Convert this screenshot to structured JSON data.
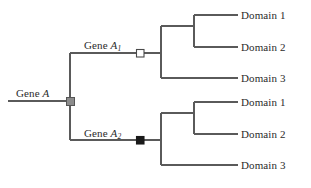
{
  "figure": {
    "background_color": "#ffffff",
    "line_color": "#5a5a5a",
    "text_color": "#2b2b2b"
  },
  "root": {
    "label_prefix": "Gene ",
    "label_gene": "A",
    "node_marker": "gray-square",
    "node_color": "#8c8c8c"
  },
  "branches": [
    {
      "label_prefix": "Gene ",
      "label_gene": "A",
      "label_subscript": "1",
      "node_marker": "white-square",
      "node_color": "#ffffff",
      "leaves": [
        {
          "label": "Domain 1"
        },
        {
          "label": "Domain 2"
        },
        {
          "label": "Domain 3"
        }
      ]
    },
    {
      "label_prefix": "Gene ",
      "label_gene": "A",
      "label_subscript": "2",
      "node_marker": "black-square",
      "node_color": "#1a1a1a",
      "leaves": [
        {
          "label": "Domain 1"
        },
        {
          "label": "Domain 2"
        },
        {
          "label": "Domain 3"
        }
      ]
    }
  ]
}
